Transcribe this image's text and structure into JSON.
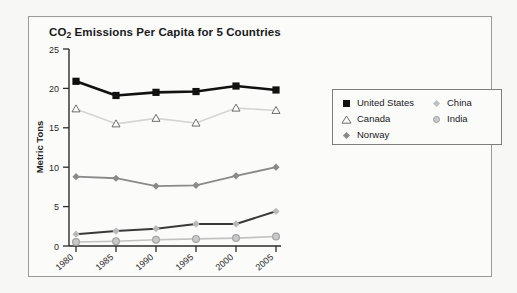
{
  "card": {
    "title_prefix": "CO",
    "title_sub": "2",
    "title_rest": " Emissions Per Capita for 5 Countries"
  },
  "chart_data": {
    "type": "line",
    "title": "CO2 Emissions Per Capita for 5 Countries",
    "xlabel": "",
    "ylabel": "Metric Tons",
    "categories": [
      "1980",
      "1985",
      "1990",
      "1995",
      "2000",
      "2005"
    ],
    "x_tick_labels": [
      "1980",
      "1985",
      "1990",
      "1995",
      "2000",
      "2005"
    ],
    "y_tick_labels": [
      "0",
      "5",
      "10",
      "15",
      "20",
      "25"
    ],
    "y_ticks": [
      0,
      5,
      10,
      15,
      20,
      25
    ],
    "ylim": [
      0,
      25
    ],
    "grid": false,
    "legend_position": "right-top",
    "series": [
      {
        "name": "United States",
        "marker": "filled-square",
        "color": "#111111",
        "line_color": "#111111",
        "line_width": 2.6,
        "values": [
          20.9,
          19.1,
          19.5,
          19.6,
          20.3,
          19.8
        ]
      },
      {
        "name": "Canada",
        "marker": "open-triangle",
        "color": "#ffffff",
        "line_color": "#d5d5d5",
        "line_width": 1.6,
        "values": [
          17.4,
          15.5,
          16.2,
          15.6,
          17.5,
          17.2
        ]
      },
      {
        "name": "Norway",
        "marker": "diamond",
        "color": "#8a8a8a",
        "line_color": "#8a8a8a",
        "line_width": 1.8,
        "values": [
          8.8,
          8.6,
          7.6,
          7.7,
          8.9,
          10.0
        ]
      },
      {
        "name": "China",
        "marker": "diamond",
        "color": "#b9b9b9",
        "line_color": "#3a3a3a",
        "line_width": 2.0,
        "values": [
          1.5,
          1.9,
          2.2,
          2.8,
          2.8,
          4.4
        ]
      },
      {
        "name": "India",
        "marker": "ringed-circle",
        "color": "#c9c9c9",
        "line_color": "#c2c2c2",
        "line_width": 1.6,
        "values": [
          0.5,
          0.6,
          0.8,
          0.9,
          1.0,
          1.2
        ]
      }
    ]
  },
  "legend": {
    "left_column": [
      {
        "label": "United States",
        "marker": "filled-square"
      },
      {
        "label": "Canada",
        "marker": "open-triangle"
      },
      {
        "label": "Norway",
        "marker": "diamond"
      }
    ],
    "right_column": [
      {
        "label": "China",
        "marker": "diamond"
      },
      {
        "label": "India",
        "marker": "ringed-circle"
      }
    ]
  },
  "colors": {
    "united_states": "#111111",
    "canada": "#d5d5d5",
    "norway": "#8a8a8a",
    "china": "#b9b9b9",
    "india": "#c9c9c9",
    "card_background": "#fbfbfa",
    "page_background": "#f7f7f5",
    "border": "#9a9a9a"
  }
}
